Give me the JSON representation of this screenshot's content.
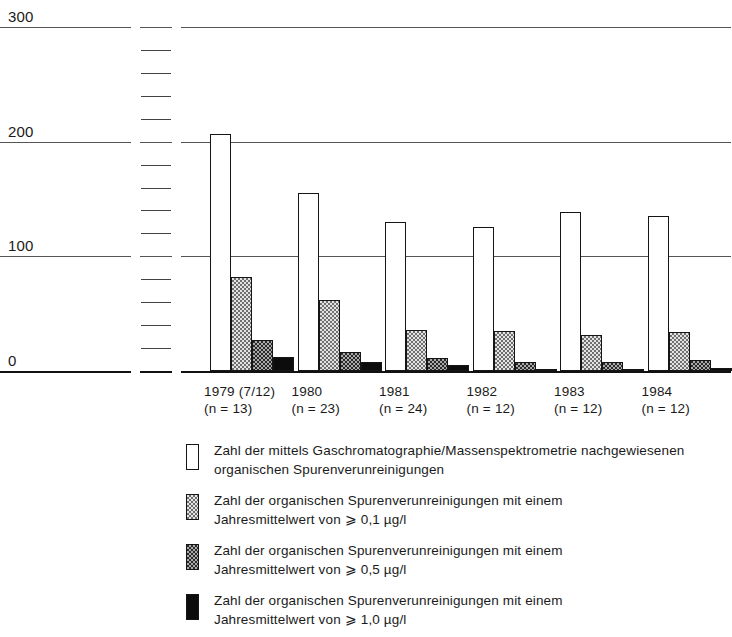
{
  "chart_data": {
    "type": "bar",
    "title": "",
    "subtitle": "",
    "xlabel": "",
    "ylabel": "",
    "ylim": [
      0,
      300
    ],
    "yticks": [
      0,
      100,
      200,
      300
    ],
    "ytick_labels": [
      "0",
      "100",
      "200",
      "300"
    ],
    "minor_tick_interval": 20,
    "grid": true,
    "legend_position": "below",
    "categories": [
      "1979 (7/12)",
      "1980",
      "1981",
      "1982",
      "1983",
      "1984"
    ],
    "category_sublabels": [
      "(n = 13)",
      "(n = 23)",
      "(n = 24)",
      "(n = 12)",
      "(n = 12)",
      "(n = 12)"
    ],
    "series": [
      {
        "name": "Zahl der mittels Gaschromatographie/Massenspektrometrie nachgewiesenen organischen Spurenverunreinigungen",
        "fill": "white",
        "values": [
          207,
          155,
          130,
          126,
          139,
          135
        ]
      },
      {
        "name": "Zahl der organischen Spurenverunreinigungen mit einem Jahresmittelwert von ⩾ 0,1 µg/l",
        "fill": "light-checker",
        "values": [
          82,
          62,
          36,
          35,
          31,
          34
        ]
      },
      {
        "name": "Zahl der organischen Spurenverunreinigungen mit einem Jahresmittelwert von ⩾ 0,5 µg/l",
        "fill": "dark-checker",
        "values": [
          27,
          17,
          11,
          8,
          8,
          10
        ]
      },
      {
        "name": "Zahl der organischen Spurenverunreinigungen mit einem Jahresmittelwert von ⩾ 1,0 µg/l",
        "fill": "solid-black",
        "values": [
          12,
          8,
          5,
          2,
          2,
          3
        ]
      }
    ]
  },
  "axis": {
    "y_labels": [
      {
        "value": "300",
        "v": 300
      },
      {
        "value": "200",
        "v": 200
      },
      {
        "value": "100",
        "v": 100
      },
      {
        "value": "0",
        "v": 0
      }
    ]
  },
  "xaxis": {
    "ticks": [
      {
        "year": "1979 (7/12)",
        "n": "(n = 13)"
      },
      {
        "year": "1980",
        "n": "(n = 23)"
      },
      {
        "year": "1981",
        "n": "(n = 24)"
      },
      {
        "year": "1982",
        "n": "(n = 12)"
      },
      {
        "year": "1983",
        "n": "(n = 12)"
      },
      {
        "year": "1984",
        "n": "(n = 12)"
      }
    ]
  },
  "legend": {
    "entries": [
      {
        "swatch": "white",
        "line1": "Zahl der mittels Gaschromatographie/Massenspektrometrie nachgewiesenen",
        "line2": "organischen Spurenverunreinigungen"
      },
      {
        "swatch": "light-checker",
        "line1": "Zahl der organischen Spurenverunreinigungen mit einem",
        "line2": "Jahresmittelwert von ⩾ 0,1 µg/l"
      },
      {
        "swatch": "dark-checker",
        "line1": "Zahl der organischen Spurenverunreinigungen mit einem",
        "line2": "Jahresmittelwert von ⩾ 0,5 µg/l"
      },
      {
        "swatch": "solid-black",
        "line1": "Zahl der organischen Spurenverunreinigungen mit einem",
        "line2": "Jahresmittelwert von ⩾ 1,0 µg/l"
      }
    ]
  },
  "colors": {
    "background": "#ffffff",
    "ink": "#1a1a1a",
    "gridline": "#555555",
    "axis": "#111111",
    "bar_white": "#ffffff",
    "bar_light": "#e4e4e4",
    "bar_dark": "#2a2a2a",
    "bar_black": "#0c0c0c"
  }
}
